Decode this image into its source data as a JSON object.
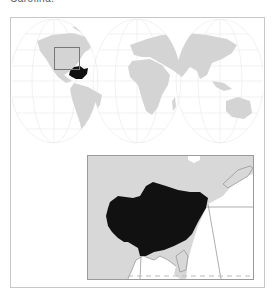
{
  "caption": {
    "text": "Carolina."
  },
  "world_map": {
    "projection": "interrupted (Goode homolosine style)",
    "land_color": "#d4d4d4",
    "graticule_color": "#e6e6e6",
    "highlight_color": "#111111"
  },
  "locator_box": {
    "label": "region-of-interest"
  },
  "inset_map": {
    "land_color": "#d6d6d6",
    "water_color": "#ffffff",
    "range_color": "#111111",
    "border_color": "#9a9a9a"
  }
}
